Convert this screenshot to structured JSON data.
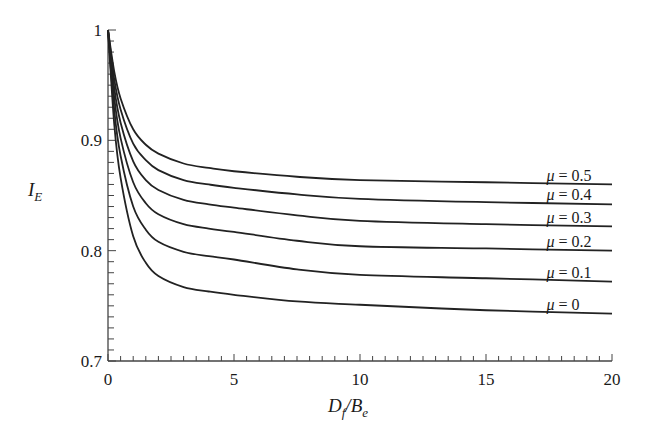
{
  "chart_data": {
    "type": "line",
    "title": "",
    "xlabel": "D_f/B_e",
    "ylabel": "I_E",
    "xlim": [
      0,
      20
    ],
    "ylim": [
      0.7,
      1.0
    ],
    "xticks": [
      0,
      5,
      10,
      15,
      20
    ],
    "xtick_labels": [
      "0",
      "5",
      "10",
      "15",
      "20"
    ],
    "x_minor_step": 0.5,
    "yticks": [
      0.7,
      0.8,
      0.9,
      1.0
    ],
    "ytick_labels": [
      "0.7",
      "0.8",
      "0.9",
      "1"
    ],
    "y_minor_step": 0.01,
    "grid": false,
    "legend": "inline labels at right end of curves",
    "x": [
      0,
      0.25,
      0.5,
      1,
      1.5,
      2,
      3,
      4,
      5,
      7.5,
      10,
      15,
      20
    ],
    "series": [
      {
        "name": "μ = 0.5",
        "values": [
          1.0,
          0.962,
          0.938,
          0.91,
          0.896,
          0.888,
          0.879,
          0.875,
          0.872,
          0.867,
          0.864,
          0.862,
          0.86
        ]
      },
      {
        "name": "μ = 0.4",
        "values": [
          1.0,
          0.955,
          0.928,
          0.897,
          0.882,
          0.873,
          0.864,
          0.86,
          0.857,
          0.851,
          0.847,
          0.844,
          0.842
        ]
      },
      {
        "name": "μ = 0.3",
        "values": [
          1.0,
          0.947,
          0.916,
          0.881,
          0.864,
          0.855,
          0.846,
          0.842,
          0.839,
          0.832,
          0.827,
          0.824,
          0.822
        ]
      },
      {
        "name": "μ = 0.2",
        "values": [
          1.0,
          0.938,
          0.902,
          0.862,
          0.843,
          0.833,
          0.824,
          0.82,
          0.817,
          0.809,
          0.804,
          0.802,
          0.8
        ]
      },
      {
        "name": "μ = 0.1",
        "values": [
          1.0,
          0.927,
          0.886,
          0.84,
          0.819,
          0.808,
          0.799,
          0.795,
          0.792,
          0.783,
          0.778,
          0.775,
          0.772
        ]
      },
      {
        "name": "μ = 0",
        "values": [
          1.0,
          0.914,
          0.866,
          0.813,
          0.789,
          0.777,
          0.767,
          0.763,
          0.76,
          0.754,
          0.751,
          0.746,
          0.743
        ]
      }
    ],
    "label_positions": [
      {
        "name": "μ = 0.5",
        "x": 17.4,
        "y": 0.8635
      },
      {
        "name": "μ = 0.4",
        "x": 17.4,
        "y": 0.8455
      },
      {
        "name": "μ = 0.3",
        "x": 17.4,
        "y": 0.8255
      },
      {
        "name": "μ = 0.2",
        "x": 17.4,
        "y": 0.8035
      },
      {
        "name": "μ = 0.1",
        "x": 17.4,
        "y": 0.7755
      },
      {
        "name": "μ = 0",
        "x": 17.4,
        "y": 0.7465
      }
    ],
    "line_color": "#222222",
    "axis_color": "#444444"
  },
  "labels": {
    "ylabel_main": "I",
    "ylabel_sub": "E",
    "xlabel_D": "D",
    "xlabel_f": "f",
    "xlabel_slash": "/",
    "xlabel_B": "B",
    "xlabel_e": "e"
  }
}
